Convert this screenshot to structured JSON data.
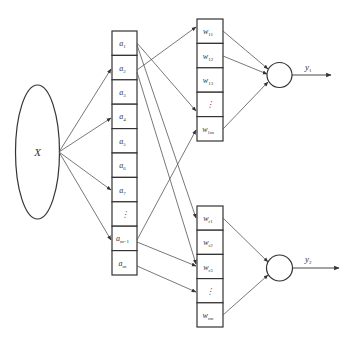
{
  "input": {
    "label": "X"
  },
  "a_column": {
    "cells": [
      {
        "base": "a",
        "sub": "1"
      },
      {
        "base": "a",
        "sub": "2"
      },
      {
        "base": "a",
        "sub": "3"
      },
      {
        "base": "a",
        "sub": "4"
      },
      {
        "base": "a",
        "sub": "5"
      },
      {
        "base": "a",
        "sub": "6"
      },
      {
        "base": "a",
        "sub": "7"
      },
      {
        "base": "⋮",
        "sub": ""
      },
      {
        "base": "a",
        "sub": "m−1"
      },
      {
        "base": "a",
        "sub": "m"
      }
    ]
  },
  "w_upper": {
    "cells": [
      {
        "base": "w",
        "sub": "11"
      },
      {
        "base": "w",
        "sub": "12"
      },
      {
        "base": "w",
        "sub": "13"
      },
      {
        "base": "⋮",
        "sub": ""
      },
      {
        "base": "w",
        "sub": "1m"
      }
    ]
  },
  "w_lower": {
    "cells": [
      {
        "base": "w",
        "sub": "r1"
      },
      {
        "base": "w",
        "sub": "r2"
      },
      {
        "base": "w",
        "sub": "r3"
      },
      {
        "base": "⋮",
        "sub": ""
      },
      {
        "base": "w",
        "sub": "rm"
      }
    ]
  },
  "outputs": [
    {
      "base": "y",
      "sub": "1"
    },
    {
      "base": "y",
      "sub": "2"
    }
  ],
  "colors": {
    "stroke": "#333333",
    "line": "#555555"
  }
}
